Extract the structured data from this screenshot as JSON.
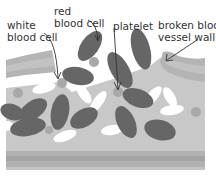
{
  "diagram": {
    "labels": {
      "white_blood_cell_line1": "white",
      "white_blood_cell_line2": "blood cell",
      "red_blood_cell_line1": "red",
      "red_blood_cell_line2": "blood cell",
      "platelet": "platelet",
      "broken_vessel_wall_line1": "broken blood",
      "broken_vessel_wall_line2": "vessel wall"
    },
    "colors": {
      "background": "#ffffff",
      "vessel_fill": "#c8c8c8",
      "wall_band_light": "#bdbdbd",
      "wall_band_dark": "#a9a9a9",
      "red_blood_cell": "#666666",
      "white_blood_cell": "#ffffff",
      "platelet": "#a8a8a8",
      "label_text": "#333333",
      "arrow": "#333333"
    }
  }
}
